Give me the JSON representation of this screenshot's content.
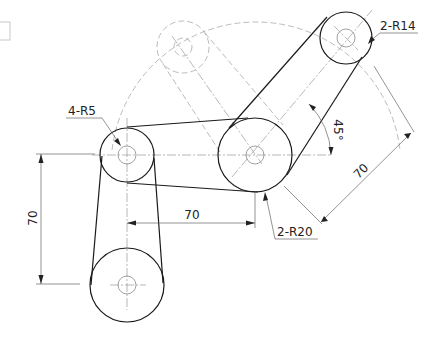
{
  "drawing": {
    "title": "Belt pulley layout drawing",
    "labels": {
      "hole_radius": "4-R5",
      "small_pulley_radius": "2-R14",
      "large_pulley_radius": "2-R20",
      "angle": "45°",
      "horizontal_distance": "70",
      "vertical_distance": "70",
      "diagonal_distance": "70"
    },
    "colors": {
      "object_line": "#1a1a1a",
      "center_line": "#9a9a9a",
      "phantom_line": "#aaaaaa",
      "dimension_line": "#666666",
      "background": "#ffffff"
    }
  }
}
